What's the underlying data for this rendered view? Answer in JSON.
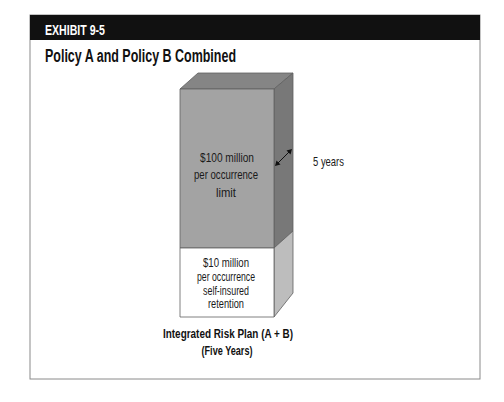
{
  "header": {
    "exhibit_label": "EXHIBIT 9-5",
    "title": "Policy A and Policy B Combined"
  },
  "diagram": {
    "upper_layer": {
      "lines": [
        "$100 million",
        "per occurrence",
        "limit"
      ],
      "color": "#a3a3a3"
    },
    "lower_layer": {
      "lines": [
        "$10 million",
        "per occurrence",
        "self-insured",
        "retention"
      ],
      "color": "#ffffff"
    },
    "depth_label": "5 years",
    "caption": {
      "line1": "Integrated Risk Plan (A + B)",
      "line2": "(Five Years)"
    }
  },
  "colors": {
    "header_bar": "#111111",
    "frame": "#8a8a8a",
    "front_upper": "#a3a3a3",
    "top_face": "#858585",
    "side_upper": "#787878",
    "side_lower": "#bdbdbd"
  }
}
